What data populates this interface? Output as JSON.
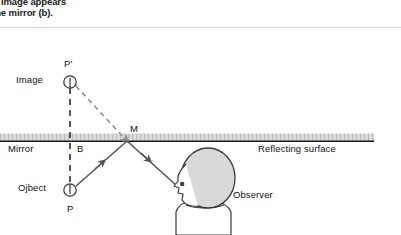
{
  "figure": {
    "caption_tail_line_1": "intersect.  The image appears",
    "caption_tail_line_2": "behind the mirror (b).",
    "labels": {
      "image_point": "P'",
      "image": "Image",
      "mirror": "Mirror",
      "normal_foot": "B",
      "mirror_point": "M",
      "reflecting_surface": "Reflecting surface",
      "object": "Ojbect",
      "object_point": "P",
      "observer": "Observer"
    },
    "colors": {
      "ink": "#111111",
      "line": "#1a1a1a",
      "ray": "#555555",
      "dashed_ray": "#8a8a8a",
      "mirror_band": "#d0d0d0",
      "head_fill": "#d9d9d9",
      "rule": "#d8d8d8"
    },
    "geometry": {
      "mirror_line_y": 141,
      "mirror_line_x_start": 0,
      "mirror_line_x_end": 374,
      "image_point_xy": [
        70,
        82
      ],
      "object_point_xy": [
        70,
        190
      ],
      "mirror_point_xy": [
        127,
        141
      ],
      "normal_foot_xy": [
        70,
        141
      ],
      "observer_eye_xy": [
        178,
        186
      ]
    }
  }
}
